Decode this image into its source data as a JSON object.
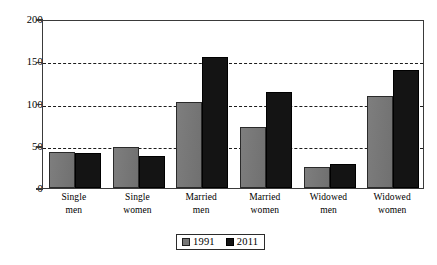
{
  "chart_data": {
    "type": "bar",
    "title": "",
    "subtitle": "",
    "xlabel": "",
    "ylabel": "",
    "categories": [
      "Single men",
      "Single women",
      "Married men",
      "Married women",
      "Widowed men",
      "Widowed women"
    ],
    "category_lines": [
      [
        "Single",
        "men"
      ],
      [
        "Single",
        "women"
      ],
      [
        "Married",
        "men"
      ],
      [
        "Married",
        "women"
      ],
      [
        "Widowed",
        "men"
      ],
      [
        "Widowed",
        "women"
      ]
    ],
    "series": [
      {
        "name": "1991",
        "color": "#767676",
        "values": [
          43,
          48,
          102,
          72,
          25,
          109
        ]
      },
      {
        "name": "2011",
        "color": "#141414",
        "values": [
          41,
          38,
          155,
          114,
          29,
          140
        ]
      }
    ],
    "ylim": [
      0,
      200
    ],
    "yticks": [
      0,
      50,
      100,
      150,
      200
    ],
    "ytick_labels": [
      "0",
      "50",
      "100",
      "150",
      "200"
    ],
    "gridlines": [
      50,
      100,
      150
    ],
    "grid": true,
    "grid_style": "dashed",
    "legend_position": "bottom-center"
  },
  "legend": {
    "entries": [
      {
        "label": "1991"
      },
      {
        "label": "2011"
      }
    ]
  },
  "colors": {
    "series_1991": "#767676",
    "series_2011": "#141414",
    "frame": "#3a3a3a",
    "grid": "#1c1c1c",
    "background": "#ffffff"
  }
}
